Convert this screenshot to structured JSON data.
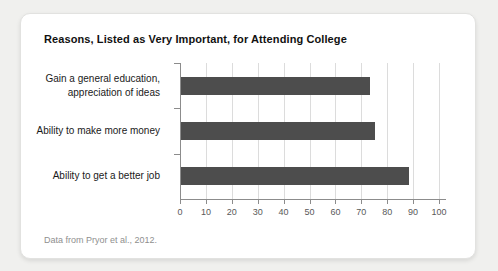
{
  "chart_data": {
    "type": "bar",
    "orientation": "horizontal",
    "title": "Reasons, Listed as Very Important, for Attending College",
    "categories": [
      "Gain a general education,\nappreciation of ideas",
      "Ability to make more money",
      "Ability to get a better job"
    ],
    "values": [
      73,
      75,
      88
    ],
    "xlabel": "",
    "ylabel": "",
    "xlim": [
      0,
      100
    ],
    "xticks": [
      0,
      10,
      20,
      30,
      40,
      50,
      60,
      70,
      80,
      90,
      100
    ],
    "grid": true,
    "legend": "none",
    "bar_color": "#4d4d4d",
    "axis_color": "#8c8c8c",
    "gridline_color": "#dcdcdc",
    "footnote": "Data from Pryor et al., 2012."
  }
}
